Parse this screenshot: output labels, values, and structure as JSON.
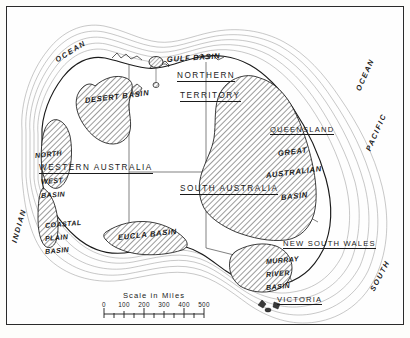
{
  "map": {
    "title": "Australia — Artesian Basins",
    "states": [
      {
        "id": "northern-territory",
        "line1": "NORTHERN",
        "line2": "TERRITORY"
      },
      {
        "id": "western-australia",
        "label": "WESTERN AUSTRALIA"
      },
      {
        "id": "south-australia",
        "label": "SOUTH AUSTRALIA"
      },
      {
        "id": "queensland",
        "label": "QUEENSLAND"
      },
      {
        "id": "new-south-wales",
        "label": "NEW SOUTH WALES"
      },
      {
        "id": "victoria",
        "label": "VICTORIA"
      }
    ],
    "basins": [
      {
        "id": "gulf-basin",
        "label": "GULF BASIN"
      },
      {
        "id": "desert-basin",
        "label": "DESERT BASIN"
      },
      {
        "id": "north-west-basin",
        "line1": "NORTH",
        "line2": "WEST",
        "line3": "BASIN"
      },
      {
        "id": "coastal-plain-basin",
        "line1": "COASTAL",
        "line2": "PLAIN",
        "line3": "BASIN"
      },
      {
        "id": "eucla-basin",
        "label": "EUCLA BASIN"
      },
      {
        "id": "great-australian-basin",
        "line1": "GREAT",
        "line2": "AUSTRALIAN",
        "line3": "BASIN"
      },
      {
        "id": "murray-river-basin",
        "line1": "MURRAY",
        "line2": "RIVER",
        "line3": "BASIN"
      }
    ],
    "oceans": [
      {
        "id": "indian-ocean-west",
        "label": "INDIAN"
      },
      {
        "id": "indian-ocean-north",
        "label": "OCEAN"
      },
      {
        "id": "pacific-ocean",
        "label": "PACIFIC"
      },
      {
        "id": "pacific-ocean-word",
        "label": "OCEAN"
      },
      {
        "id": "southern-ocean",
        "label": "SOUTH"
      }
    ],
    "scale": {
      "title": "Scale in Miles",
      "ticks": [
        "0",
        "100",
        "200",
        "300",
        "400",
        "500"
      ],
      "unit": "Miles",
      "max": 500
    },
    "colors": {
      "ink": "#1a1a1a",
      "paper": "#fefefe",
      "hatch": "#4a4a4a",
      "coast_shade": "#8a8a8a",
      "border": "#2b2b2b"
    }
  }
}
